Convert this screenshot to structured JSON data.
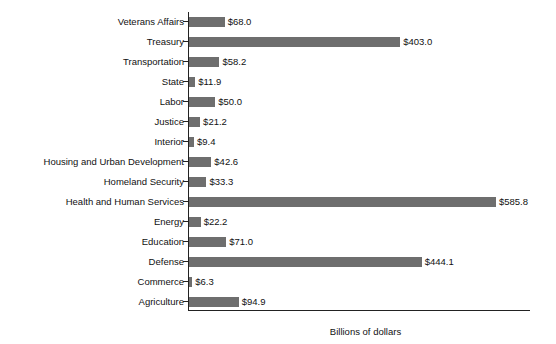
{
  "chart_data": {
    "type": "bar",
    "orientation": "horizontal",
    "title": "",
    "xlabel": "Billions of dollars",
    "ylabel": "",
    "grid": false,
    "legend": "none",
    "xlim": [
      0,
      650
    ],
    "value_prefix": "$",
    "categories": [
      "Veterans Affairs",
      "Treasury",
      "Transportation",
      "State",
      "Labor",
      "Justice",
      "Interior",
      "Housing and Urban Development",
      "Homeland Security",
      "Health and Human Services",
      "Energy",
      "Education",
      "Defense",
      "Commerce",
      "Agriculture"
    ],
    "values": [
      68.0,
      403.0,
      58.2,
      11.9,
      50.0,
      21.2,
      9.4,
      42.6,
      33.3,
      585.8,
      22.2,
      71.0,
      444.1,
      6.3,
      94.9
    ],
    "value_labels": [
      "$68.0",
      "$403.0",
      "$58.2",
      "$11.9",
      "$50.0",
      "$21.2",
      "$9.4",
      "$42.6",
      "$33.3",
      "$585.8",
      "$22.2",
      "$71.0",
      "$444.1",
      "$6.3",
      "$94.9"
    ],
    "bar_color": "#6e6e6e",
    "axis_color": "#222222",
    "background": "#ffffff"
  },
  "axis": {
    "x_title": "Billions of dollars"
  }
}
